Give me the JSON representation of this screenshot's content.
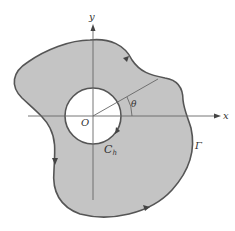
{
  "diagram": {
    "type": "multiply-connected-region",
    "labels": {
      "x_axis": "x",
      "y_axis": "y",
      "origin": "O",
      "angle": "θ",
      "inner_contour": "C",
      "inner_contour_sub": "h",
      "outer_contour": "Γ"
    },
    "colors": {
      "region_fill": "#c4c4c4",
      "contour_stroke": "#555555",
      "axis_stroke": "#666666",
      "hole_fill": "#ffffff"
    }
  }
}
